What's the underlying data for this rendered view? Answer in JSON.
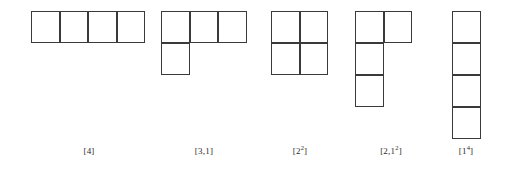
{
  "figure": {
    "background_color": "#ffffff",
    "stroke_color": "#3a3a3a",
    "label_color": "#2b2b2b",
    "cell_width": 28.5,
    "cell_height": 32,
    "top": 11
  },
  "diagrams": [
    {
      "name": "partition-4",
      "partition": [
        4
      ],
      "rows": [
        4
      ],
      "left": 31,
      "label": {
        "base": "[4",
        "sup": "",
        "tail": "]",
        "text": "[4]",
        "center_x": 89,
        "y": 146
      }
    },
    {
      "name": "partition-3-1",
      "partition": [
        3,
        1
      ],
      "rows": [
        3,
        1
      ],
      "left": 161,
      "label": {
        "base": "[3,1",
        "sup": "",
        "tail": "]",
        "text": "[3,1]",
        "center_x": 204,
        "y": 146
      }
    },
    {
      "name": "partition-2-2",
      "partition": [
        2,
        2
      ],
      "rows": [
        2,
        2
      ],
      "left": 271,
      "label": {
        "base": "[2",
        "sup": "2",
        "tail": "]",
        "text": "[2²]",
        "center_x": 300,
        "y": 146
      }
    },
    {
      "name": "partition-2-1-1",
      "partition": [
        2,
        1,
        1
      ],
      "rows": [
        2,
        1,
        1
      ],
      "left": 355,
      "label": {
        "base": "[2,1",
        "sup": "2",
        "tail": "]",
        "text": "[2,1²]",
        "center_x": 391,
        "y": 146
      }
    },
    {
      "name": "partition-1-1-1-1",
      "partition": [
        1,
        1,
        1,
        1
      ],
      "rows": [
        1,
        1,
        1,
        1
      ],
      "left": 452,
      "label": {
        "base": "[1",
        "sup": "4",
        "tail": "]",
        "text": "[1⁴]",
        "center_x": 466,
        "y": 146
      }
    }
  ]
}
